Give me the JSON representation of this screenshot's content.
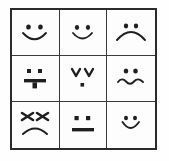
{
  "image": {
    "title": "Hand-drawn emoticon face grid",
    "background_color": "#ffffff",
    "frame_color": "#2b2b2b",
    "grid_line_color": "#3a3a3a",
    "ink_color": "#1f1f1f",
    "rows": 3,
    "columns": 3
  },
  "grid": {
    "cells": [
      {
        "position": "row-1-col-1",
        "icon": "smiling-face-icon",
        "label": "Smiling face",
        "eyes": "round dots",
        "mouth": "wide upward smile curve"
      },
      {
        "position": "row-1-col-2",
        "icon": "smiling-face-icon",
        "label": "Smiling face",
        "eyes": "round dots",
        "mouth": "upward smile curve"
      },
      {
        "position": "row-1-col-3",
        "icon": "frowning-face-icon",
        "label": "Frowning sad face",
        "eyes": "round dots",
        "mouth": "wide downward frown curve"
      },
      {
        "position": "row-2-col-1",
        "icon": "tongue-out-face-icon",
        "label": "Face with tongue sticking out",
        "eyes": "square dots",
        "mouth": "horizontal bar with hanging tongue"
      },
      {
        "position": "row-2-col-2",
        "icon": "closed-eyes-face-icon",
        "label": "Face with closed v-shaped eyes",
        "eyes": "downward v chevrons",
        "mouth": "single small dot"
      },
      {
        "position": "row-2-col-3",
        "icon": "confused-face-icon",
        "label": "Confused face with wavy mouth",
        "eyes": "round dots",
        "mouth": "wavy squiggle line"
      },
      {
        "position": "row-3-col-1",
        "icon": "angry-face-icon",
        "label": "Angry face",
        "eyes": "slanted angry brows",
        "mouth": "downward frown curve"
      },
      {
        "position": "row-3-col-2",
        "icon": "neutral-face-icon",
        "label": "Neutral face",
        "eyes": "square dots",
        "mouth": "straight horizontal line"
      },
      {
        "position": "row-3-col-3",
        "icon": "smiling-face-icon",
        "label": "Small smiling face",
        "eyes": "round dots",
        "mouth": "narrow upward smile curve"
      }
    ]
  }
}
